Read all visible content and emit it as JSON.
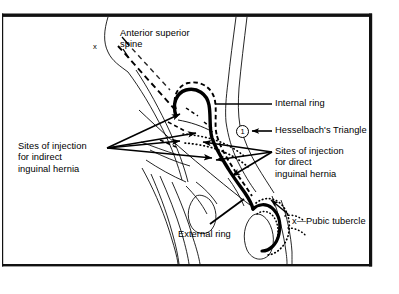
{
  "figure": {
    "border_color": "#111111",
    "line_color": "#000000",
    "background": "#ffffff"
  },
  "labels": {
    "anterior_superior_spine": "Anterior superior\nspine",
    "internal_ring": "Internal ring",
    "hesselbachs_triangle": "Hesselbach's Triangle",
    "sites_direct": "Sites of injection\nfor direct\ninguinal hernia",
    "sites_indirect": "Sites of injection\nfor indirect\ninguinal hernia",
    "external_ring": "External ring",
    "pubic_tubercle": "x—Pubic tubercle",
    "spine_marker": "x",
    "region_number": "1"
  }
}
